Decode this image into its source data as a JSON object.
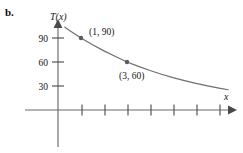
{
  "figure": {
    "part_label": "b.",
    "axis_titles": {
      "y": "T(x)",
      "x": "x"
    },
    "point_labels": {
      "p1": "(1, 90)",
      "p2": "(3, 60)"
    },
    "colors": {
      "curve": "#6f6f6f",
      "axis": "#6b6b6b",
      "tick": "#4f4f4f",
      "point": "#5a5a5a",
      "text": "#141414"
    }
  },
  "chart_data": {
    "type": "line",
    "title": "",
    "subtitle": "",
    "xlabel": "x",
    "ylabel": "T(x)",
    "xlim": [
      -1.45,
      7.6
    ],
    "ylim": [
      0,
      112
    ],
    "grid": false,
    "legend": null,
    "yticks": [
      30,
      60,
      90
    ],
    "ytick_labels": [
      "30",
      "60",
      "90"
    ],
    "xticks": [
      1,
      2,
      3,
      4,
      5,
      6,
      7
    ],
    "xtick_labels": [
      "",
      "",
      "",
      "",
      "",
      "",
      ""
    ],
    "series": [
      {
        "name": "T(x)",
        "description": "decreasing exponential decay curve",
        "x": [
          0.3,
          0.5,
          1.0,
          1.5,
          2.0,
          2.5,
          3.0,
          3.5,
          4.0,
          4.5,
          5.0,
          5.5,
          6.0,
          6.5,
          7.0,
          7.4
        ],
        "y": [
          103.5,
          99.5,
          90.0,
          81.5,
          73.9,
          66.8,
          60.0,
          54.5,
          49.4,
          44.7,
          40.5,
          36.7,
          33.2,
          30.1,
          27.3,
          25.3
        ]
      }
    ],
    "annotations": [
      {
        "label": "(1, 90)",
        "x": 1,
        "y": 90,
        "marker": true,
        "label_position": "right"
      },
      {
        "label": "(3, 60)",
        "x": 3,
        "y": 60,
        "marker": true,
        "label_position": "below"
      }
    ]
  }
}
